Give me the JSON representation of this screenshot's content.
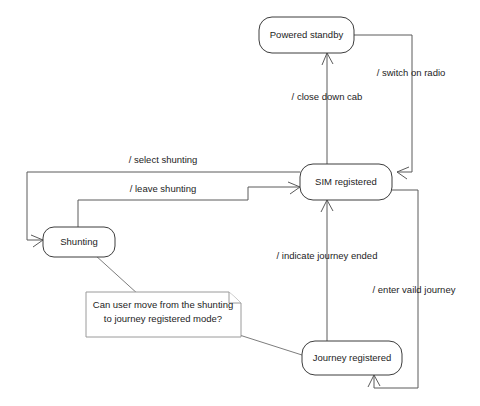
{
  "diagram": {
    "type": "state-machine-diagram",
    "background_color": "#ffffff",
    "node_stroke_color": "#3d3d3d",
    "edge_stroke_color": "#5a5a5a",
    "note_stroke_color": "#9a9a9a",
    "text_color": "#1d1d1d"
  },
  "states": [
    {
      "id": "powered_standby",
      "label": "Powered standby"
    },
    {
      "id": "sim_registered",
      "label": "SIM registered"
    },
    {
      "id": "shunting",
      "label": "Shunting"
    },
    {
      "id": "journey_registered",
      "label": "Journey registered"
    }
  ],
  "transitions": [
    {
      "id": "switch_on_radio",
      "label": "/ switch on radio",
      "from": "Powered standby",
      "to": "SIM registered"
    },
    {
      "id": "close_down_cab",
      "label": "/ close down cab",
      "from": "SIM registered",
      "to": "Powered standby"
    },
    {
      "id": "select_shunting",
      "label": "/ select shunting",
      "from": "SIM registered",
      "to": "Shunting"
    },
    {
      "id": "leave_shunting",
      "label": "/ leave shunting",
      "from": "Shunting",
      "to": "SIM registered"
    },
    {
      "id": "indicate_journey_ended",
      "label": "/ indicate journey ended",
      "from": "Journey registered",
      "to": "SIM registered"
    },
    {
      "id": "enter_vaild_journey",
      "label": "/ enter vaild journey",
      "from": "SIM registered",
      "to": "Journey registered"
    }
  ],
  "note": {
    "id": "shunting_question_note",
    "line1": "Can user move from the shunting",
    "line2": "to journey registered mode?",
    "attached_to": [
      "Shunting",
      "Journey registered"
    ]
  }
}
